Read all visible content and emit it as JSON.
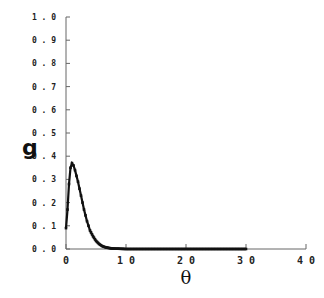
{
  "chart_data": {
    "type": "line",
    "title": "",
    "xlabel": "θ",
    "ylabel": "g",
    "xlim": [
      0,
      40
    ],
    "ylim": [
      0,
      1.0
    ],
    "grid": false,
    "legend": null,
    "x_ticks": [
      "0",
      "10",
      "20",
      "30",
      "40"
    ],
    "y_ticks": [
      "0.0",
      "0.1",
      "0.2",
      "0.3",
      "0.4",
      "0.5",
      "0.6",
      "0.7",
      "0.8",
      "0.9",
      "1.0"
    ],
    "series": [
      {
        "name": "g(θ)",
        "color": "#111111",
        "marker": "square",
        "x": [
          0,
          0.25,
          0.5,
          0.75,
          1.0,
          1.25,
          1.5,
          1.75,
          2.0,
          2.25,
          2.5,
          2.75,
          3.0,
          3.25,
          3.5,
          3.75,
          4.0,
          4.5,
          5.0,
          5.5,
          6.0,
          6.5,
          7.0,
          7.5,
          8.0,
          9,
          10,
          12,
          14,
          16,
          18,
          20,
          22,
          24,
          26,
          28,
          30
        ],
        "y": [
          0.09,
          0.17,
          0.28,
          0.35,
          0.37,
          0.36,
          0.34,
          0.315,
          0.29,
          0.26,
          0.23,
          0.2,
          0.17,
          0.145,
          0.12,
          0.1,
          0.08,
          0.055,
          0.035,
          0.022,
          0.013,
          0.008,
          0.005,
          0.003,
          0.002,
          0.001,
          0,
          0,
          0,
          0,
          0,
          0,
          0,
          0,
          0,
          0,
          0
        ]
      }
    ]
  }
}
